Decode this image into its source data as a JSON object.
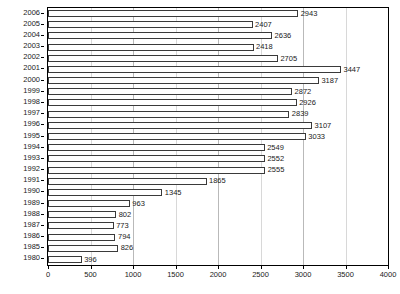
{
  "chart_data": {
    "type": "bar",
    "orientation": "horizontal",
    "title": "",
    "subtitle": "",
    "xlabel": "",
    "ylabel": "",
    "xlim": [
      0,
      4000
    ],
    "ylim": null,
    "grid": true,
    "legend": null,
    "xticks": [
      0,
      500,
      1000,
      1500,
      2000,
      2500,
      3000,
      3500,
      4000
    ],
    "xtick_labels": [
      "0",
      "500",
      "1000",
      "1500",
      "2000",
      "2500",
      "3000",
      "3500",
      "4000"
    ],
    "categories": [
      "2006",
      "2005",
      "2004",
      "2003",
      "2002",
      "2001",
      "2000",
      "1999",
      "1998",
      "1997",
      "1996",
      "1995",
      "1994",
      "1993",
      "1992",
      "1991",
      "1990",
      "1989",
      "1988",
      "1987",
      "1986",
      "1985",
      "1980"
    ],
    "values": [
      2943,
      2407,
      2636,
      2418,
      2705,
      3447,
      3187,
      2872,
      2926,
      2839,
      3107,
      3033,
      2549,
      2552,
      2555,
      1865,
      1345,
      963,
      802,
      773,
      794,
      826,
      396
    ],
    "data_labels": [
      "2943",
      "2407",
      "2636",
      "2418",
      "2705",
      "3447",
      "3187",
      "2872",
      "2926",
      "2839",
      "3107",
      "3033",
      "2549",
      "2552",
      "2555",
      "1865",
      "1345",
      "963",
      "802",
      "773",
      "794",
      "826",
      "396"
    ],
    "bar_fill_color": "#ffffff",
    "bar_edge_color": "#3a3a3a",
    "gridline_color": "#b9b9b9",
    "axis_color": "#000000",
    "background_color": "#ffffff"
  }
}
